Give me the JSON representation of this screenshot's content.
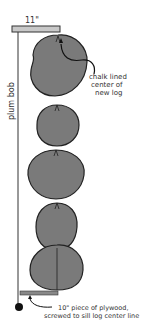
{
  "diagram": {
    "top_measure_label": "11\"",
    "plumb_label": "plum bob",
    "callout_top": [
      "chalk lined",
      "center of",
      "new log"
    ],
    "callout_bottom": [
      "10\" piece of plywood,",
      "screwed to sill log center line"
    ],
    "colors": {
      "log_fill": "#7a7a7a",
      "log_stroke": "#222222",
      "board_fill": "#c8c8c8",
      "line": "#222222"
    }
  }
}
